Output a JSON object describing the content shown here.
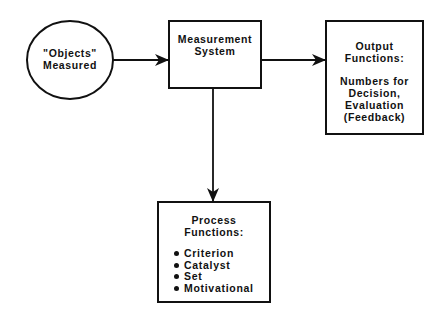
{
  "diagram": {
    "nodes": {
      "objects": {
        "shape": "ellipse",
        "lines": [
          "\"Objects\"",
          "Measured"
        ]
      },
      "measurement": {
        "shape": "rectangle",
        "lines": [
          "Measurement",
          "System"
        ]
      },
      "output": {
        "shape": "rectangle",
        "title_lines": [
          "Output",
          "Functions:"
        ],
        "body_lines": [
          "Numbers for",
          "Decision,",
          "Evaluation",
          "(Feedback)"
        ]
      },
      "process": {
        "shape": "rectangle",
        "title_lines": [
          "Process",
          "Functions:"
        ],
        "items": [
          "Criterion",
          "Catalyst",
          "Set",
          "Motivational"
        ]
      }
    },
    "edges": [
      {
        "from": "objects",
        "to": "measurement"
      },
      {
        "from": "measurement",
        "to": "output"
      },
      {
        "from": "measurement",
        "to": "process"
      }
    ],
    "colors": {
      "stroke": "#111111",
      "background": "#ffffff"
    }
  }
}
